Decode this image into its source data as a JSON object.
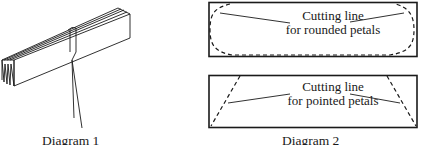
{
  "diagram1": {
    "caption": "Diagram 1",
    "subject": "folded-paper-bundle-tied-with-string"
  },
  "diagram2": {
    "caption": "Diagram 2",
    "panels": [
      {
        "line1": "Cutting line",
        "line2": "for rounded petals",
        "cut_shape": "rounded"
      },
      {
        "line1": "Cutting line",
        "line2": "for pointed petals",
        "cut_shape": "pointed"
      }
    ]
  },
  "colors": {
    "ink": "#1a1a1a",
    "background": "#ffffff"
  }
}
